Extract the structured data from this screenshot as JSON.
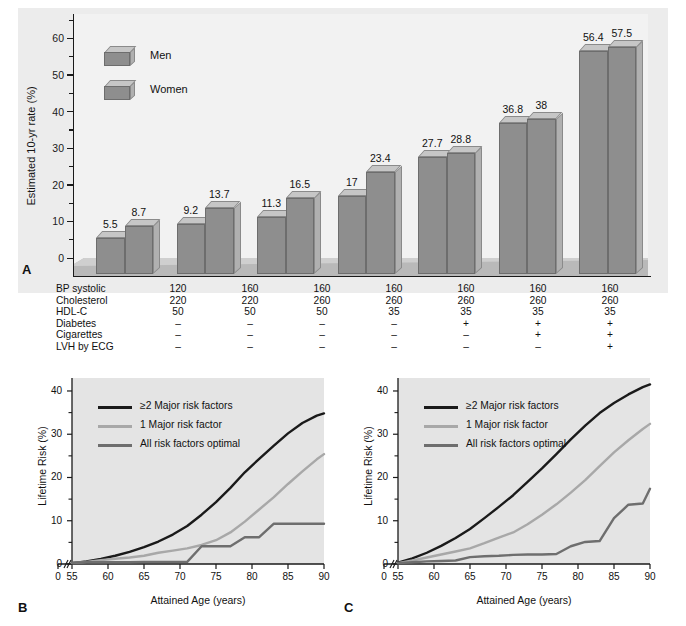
{
  "figure": {
    "panels": [
      {
        "letter": "A"
      },
      {
        "letter": "B"
      },
      {
        "letter": "C"
      }
    ]
  },
  "panelA": {
    "letter": "A",
    "ylabel": "Estimated 10-yr rate (%)",
    "yticks": [
      "0",
      "10",
      "20",
      "30",
      "40",
      "50",
      "60"
    ],
    "legend": [
      {
        "label": "Men"
      },
      {
        "label": "Women"
      }
    ],
    "chart_data": {
      "type": "bar",
      "title": "",
      "xlabel": "",
      "ylabel": "Estimated 10-yr rate (%)",
      "ylim": [
        0,
        65
      ],
      "yticks": [
        0,
        10,
        20,
        30,
        40,
        50,
        60
      ],
      "minor_tick_interval": 5,
      "grid": false,
      "legend_position": "upper-left",
      "categories": [
        "1",
        "2",
        "3",
        "4",
        "5",
        "6",
        "7"
      ],
      "series": [
        {
          "name": "Men",
          "values": [
            5.5,
            9.2,
            11.3,
            17,
            27.7,
            36.8,
            56.4
          ]
        },
        {
          "name": "Women",
          "values": [
            8.7,
            13.7,
            16.5,
            23.4,
            28.8,
            38,
            57.5
          ]
        }
      ],
      "bar_labels": [
        [
          "5.5",
          "8.7"
        ],
        [
          "9.2",
          "13.7"
        ],
        [
          "11.3",
          "16.5"
        ],
        [
          "17",
          "23.4"
        ],
        [
          "27.7",
          "28.8"
        ],
        [
          "36.8",
          "38"
        ],
        [
          "56.4",
          "57.5"
        ]
      ]
    }
  },
  "riskTable": {
    "rows": [
      {
        "label": "BP systolic",
        "values": [
          "120",
          "160",
          "160",
          "160",
          "160",
          "160",
          "160"
        ]
      },
      {
        "label": "Cholesterol",
        "values": [
          "220",
          "220",
          "260",
          "260",
          "260",
          "260",
          "260"
        ]
      },
      {
        "label": "HDL-C",
        "values": [
          "50",
          "50",
          "50",
          "35",
          "35",
          "35",
          "35"
        ]
      },
      {
        "label": "Diabetes",
        "values": [
          "–",
          "–",
          "–",
          "–",
          "+",
          "+",
          "+"
        ]
      },
      {
        "label": "Cigarettes",
        "values": [
          "–",
          "–",
          "–",
          "–",
          "–",
          "+",
          "+"
        ]
      },
      {
        "label": "LVH by ECG",
        "values": [
          "–",
          "–",
          "–",
          "–",
          "–",
          "–",
          "+"
        ]
      }
    ]
  },
  "panelB": {
    "letter": "B",
    "ylabel": "Lifetime Risk (%)",
    "xlabel": "Attained Age (years)",
    "yticks": [
      "0",
      "10",
      "20",
      "30",
      "40"
    ],
    "xticks": [
      "0",
      "55",
      "60",
      "65",
      "70",
      "75",
      "80",
      "85",
      "90"
    ],
    "legend": [
      {
        "label": "≥2 Major risk factors",
        "color": "#1a1a1a"
      },
      {
        "label": "1 Major risk factor",
        "color": "#a8a8a8"
      },
      {
        "label": "All risk factors optimal",
        "color": "#6e6e6e"
      }
    ],
    "chart_data": {
      "type": "line",
      "title": "",
      "xlabel": "Attained Age (years)",
      "ylabel": "Lifetime Risk (%)",
      "xlim": [
        55,
        90
      ],
      "ylim": [
        0,
        43
      ],
      "xticks": [
        0,
        55,
        60,
        65,
        70,
        75,
        80,
        85,
        90
      ],
      "yticks": [
        0,
        10,
        20,
        30,
        40
      ],
      "axis_break": "between 0 and 55",
      "grid": false,
      "legend_position": "upper-left",
      "x": [
        55,
        57,
        59,
        61,
        63,
        65,
        67,
        69,
        71,
        73,
        75,
        77,
        79,
        81,
        83,
        85,
        87,
        89,
        90
      ],
      "series": [
        {
          "name": "≥2 Major risk factors",
          "color": "#1a1a1a",
          "values": [
            0.2,
            0.6,
            1.2,
            1.9,
            2.8,
            3.9,
            5.2,
            6.8,
            8.8,
            11.4,
            14.3,
            17.6,
            21.2,
            24.3,
            27.3,
            30.2,
            32.6,
            34.3,
            34.8
          ]
        },
        {
          "name": "1 Major risk factor",
          "color": "#a8a8a8",
          "values": [
            0.2,
            0.5,
            0.9,
            1.2,
            1.5,
            1.9,
            2.6,
            3.1,
            3.6,
            4.4,
            5.5,
            7.3,
            9.8,
            12.6,
            15.4,
            18.5,
            21.4,
            24.2,
            25.4
          ]
        },
        {
          "name": "All risk factors optimal",
          "color": "#6e6e6e",
          "values": [
            0.3,
            0.4,
            0.4,
            0.4,
            0.4,
            0.5,
            0.5,
            0.5,
            0.5,
            4.1,
            4.1,
            4.1,
            6.2,
            6.2,
            9.3,
            9.3,
            9.3,
            9.3,
            9.3
          ]
        }
      ]
    }
  },
  "panelC": {
    "letter": "C",
    "ylabel": "Lifetime Risk (%)",
    "xlabel": "Attained Age (years)",
    "yticks": [
      "0",
      "10",
      "20",
      "30",
      "40"
    ],
    "xticks": [
      "0",
      "55",
      "60",
      "65",
      "70",
      "75",
      "80",
      "85",
      "90"
    ],
    "legend": [
      {
        "label": "≥2 Major risk factors",
        "color": "#1a1a1a"
      },
      {
        "label": "1 Major risk factor",
        "color": "#a8a8a8"
      },
      {
        "label": "All risk factors optimal",
        "color": "#6e6e6e"
      }
    ],
    "chart_data": {
      "type": "line",
      "title": "",
      "xlabel": "Attained Age (years)",
      "ylabel": "Lifetime Risk (%)",
      "xlim": [
        55,
        90
      ],
      "ylim": [
        0,
        43
      ],
      "xticks": [
        0,
        55,
        60,
        65,
        70,
        75,
        80,
        85,
        90
      ],
      "yticks": [
        0,
        10,
        20,
        30,
        40
      ],
      "axis_break": "between 0 and 55",
      "grid": false,
      "legend_position": "upper-left",
      "x": [
        55,
        57,
        59,
        61,
        63,
        65,
        67,
        69,
        71,
        73,
        75,
        77,
        79,
        81,
        83,
        85,
        87,
        89,
        90
      ],
      "series": [
        {
          "name": "≥2 Major risk factors",
          "color": "#1a1a1a",
          "values": [
            0.3,
            1.3,
            2.6,
            4.2,
            6.0,
            8.1,
            10.6,
            13.2,
            15.9,
            19.0,
            22.1,
            25.4,
            28.8,
            32.0,
            34.9,
            37.2,
            39.2,
            40.9,
            41.5
          ]
        },
        {
          "name": "1 Major risk factor",
          "color": "#a8a8a8",
          "values": [
            0.2,
            0.8,
            1.5,
            2.2,
            2.9,
            3.6,
            4.8,
            6.1,
            7.3,
            9.2,
            11.4,
            13.8,
            16.5,
            19.4,
            22.6,
            25.8,
            28.6,
            31.2,
            32.4
          ]
        },
        {
          "name": "All risk factors optimal",
          "color": "#6e6e6e",
          "values": [
            0.2,
            0.4,
            0.6,
            0.7,
            0.8,
            1.6,
            1.8,
            1.9,
            2.1,
            2.2,
            2.2,
            2.3,
            4.1,
            5.1,
            5.3,
            10.6,
            13.7,
            14.0,
            17.4
          ]
        }
      ]
    }
  }
}
